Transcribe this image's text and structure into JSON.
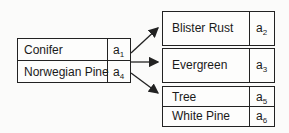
{
  "source": {
    "rows": [
      {
        "label": "Conifer",
        "attr": "a",
        "sub": "1"
      },
      {
        "label": "Norwegian Pine",
        "attr": "a",
        "sub": "4"
      }
    ]
  },
  "targets": [
    {
      "rows": [
        {
          "label": "Blister Rust",
          "attr": "a",
          "sub": "2"
        }
      ]
    },
    {
      "rows": [
        {
          "label": "Evergreen",
          "attr": "a",
          "sub": "3"
        }
      ]
    },
    {
      "rows": [
        {
          "label": "Tree",
          "attr": "a",
          "sub": "5"
        },
        {
          "label": "White Pine",
          "attr": "a",
          "sub": "6"
        }
      ]
    }
  ],
  "arrows": [
    "source->target-1",
    "source->target-2",
    "source->target-3"
  ]
}
